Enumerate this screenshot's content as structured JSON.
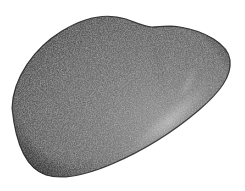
{
  "figure": {
    "subject_name": "bean-shaped stone specimen",
    "medium": "stippled engraving halftone",
    "background_color": "#ffffff",
    "canvas": {
      "width": 245,
      "height": 191
    },
    "alt_text": "Monochrome stippled engraving of a smooth asymmetric bean- or heart-shaped object on a plain white background, lit from the lower right."
  },
  "form": {
    "silhouette_name": "bean-heart-outline",
    "outline_path": "M 12 108 C 13 78 34 48 62 31 C 88 15 110 14 126 19 C 137 23 145 27 152 27 C 159 27 168 25 180 27 C 205 31 228 44 230 60 C 232 76 220 92 199 110 C 172 133 140 152 112 164 C 86 175 62 180 46 175 C 28 169 16 148 12 108 Z",
    "extremes": {
      "leftmost": {
        "x": 12,
        "y": 108
      },
      "topmost": {
        "x": 110,
        "y": 17
      },
      "rightmost": {
        "x": 230,
        "y": 60
      },
      "bottommost": {
        "x": 55,
        "y": 178
      },
      "notch": {
        "x": 152,
        "y": 27
      }
    },
    "lobes": [
      {
        "name": "major-left-lobe",
        "center_x": 80,
        "center_y": 95
      },
      {
        "name": "minor-right-lobe",
        "center_x": 190,
        "center_y": 62
      }
    ],
    "crease_path": "M 152 27 C 156 48 160 70 165 92"
  },
  "tone": {
    "base_fill": "#5b5b5b",
    "midtone": "#666666",
    "shadow_dark": "#2e2e2e",
    "shadow_mid": "#3f3f3f",
    "highlight_bright": "#c6c6c6",
    "highlight_soft": "#9a9a9a",
    "edge_line": "#1d1d1d",
    "grain_dark": "#1a1a1a",
    "grain_light": "#b8b8b8"
  },
  "lighting": {
    "source_label": "lower-right",
    "highlight_band_path": "M 214 74 C 206 92 186 113 162 131 C 146 143 131 151 120 155 C 133 146 150 133 167 118 C 188 100 204 85 214 74 Z",
    "secondary_highlight_path": "M 196 58 C 200 70 192 86 176 102 C 186 86 193 70 196 58 Z",
    "shadow_region_path": "M 12 108 C 16 148 28 169 46 175 C 62 180 86 175 112 164 C 88 168 62 166 44 156 C 26 146 16 128 12 108 Z",
    "upper_shadow_path": "M 62 31 C 34 48 13 78 12 108 C 18 80 38 54 66 38 Z"
  },
  "texture": {
    "name": "stipple-grain",
    "description": "dense random engraved stipple",
    "dot_density": "high",
    "hatch_angle_degrees": 28
  }
}
